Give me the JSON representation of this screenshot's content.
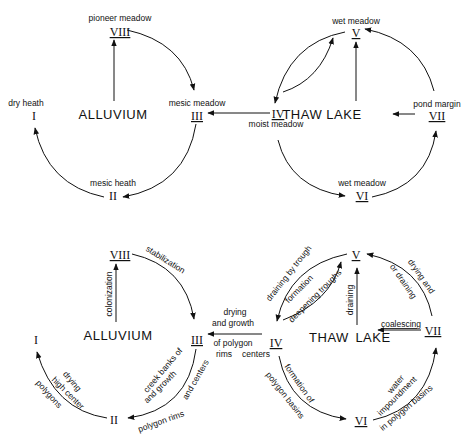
{
  "diagram": {
    "title": "",
    "panels": [
      {
        "id": "top-left",
        "center_label": "ALLUVIUM",
        "nodes": [
          {
            "id": "VIII",
            "numeral": "VIII",
            "label": "pioneer meadow"
          },
          {
            "id": "III",
            "numeral": "III",
            "label": "mesic meadow"
          },
          {
            "id": "II",
            "numeral": "II",
            "label": "mesic heath"
          },
          {
            "id": "I",
            "numeral": "I",
            "label": "dry heath"
          }
        ],
        "edges": [
          {
            "from": "ALLUVIUM",
            "to": "VIII",
            "label": ""
          },
          {
            "from": "VIII",
            "to": "III",
            "label": ""
          },
          {
            "from": "III",
            "to": "II",
            "label": ""
          },
          {
            "from": "II",
            "to": "I",
            "label": ""
          }
        ]
      },
      {
        "id": "top-right",
        "center_label": "THAW LAKE",
        "nodes": [
          {
            "id": "V",
            "numeral": "V",
            "label": "wet meadow"
          },
          {
            "id": "IV",
            "numeral": "IV",
            "label": "moist meadow"
          },
          {
            "id": "VI",
            "numeral": "VI",
            "label": "wet meadow"
          },
          {
            "id": "VII",
            "numeral": "VII",
            "label": "pond margin"
          }
        ],
        "edges": [
          {
            "from": "THAW LAKE",
            "to": "V",
            "label": ""
          },
          {
            "from": "V",
            "to": "IV",
            "label": ""
          },
          {
            "from": "IV",
            "to": "V",
            "label": ""
          },
          {
            "from": "IV",
            "to": "VI",
            "label": ""
          },
          {
            "from": "VI",
            "to": "VII",
            "label": ""
          },
          {
            "from": "VII",
            "to": "V",
            "label": ""
          },
          {
            "from": "VII",
            "to": "THAW LAKE",
            "label": ""
          }
        ]
      },
      {
        "id": "bottom-left",
        "center_label": "ALLUVIUM",
        "nodes": [
          {
            "id": "VIII",
            "numeral": "VIII"
          },
          {
            "id": "III",
            "numeral": "III"
          },
          {
            "id": "II",
            "numeral": "II"
          },
          {
            "id": "I",
            "numeral": "I"
          }
        ],
        "edges": [
          {
            "from": "ALLUVIUM",
            "to": "VIII",
            "label": "colonization"
          },
          {
            "from": "VIII",
            "to": "III",
            "label": "stabilization"
          },
          {
            "from": "III",
            "to": "II",
            "label_lines": [
              "creek banks",
              "and growth of",
              "polygon rims and centers"
            ]
          },
          {
            "from": "II",
            "to": "I",
            "label_lines": [
              "drying",
              "high center",
              "polygons"
            ]
          }
        ]
      },
      {
        "id": "bottom-right",
        "center_label": "THAW LAKE",
        "nodes": [
          {
            "id": "V",
            "numeral": "V"
          },
          {
            "id": "IV",
            "numeral": "IV"
          },
          {
            "id": "VI",
            "numeral": "VI"
          },
          {
            "id": "VII",
            "numeral": "VII"
          }
        ],
        "edges": [
          {
            "from": "THAW LAKE",
            "to": "V",
            "label": "draining"
          },
          {
            "from": "V",
            "to": "IV",
            "label_lines": [
              "draining by trough",
              "formation"
            ]
          },
          {
            "from": "IV",
            "to": "V",
            "label": "deepening troughs"
          },
          {
            "from": "IV",
            "to": "VI",
            "label_lines": [
              "formation of",
              "polygon basins"
            ]
          },
          {
            "from": "VI",
            "to": "VII",
            "label_lines": [
              "water",
              "impoundment",
              "in polygon basins"
            ]
          },
          {
            "from": "VII",
            "to": "V",
            "label_lines": [
              "drying and",
              "or draining"
            ]
          },
          {
            "from": "VII",
            "to": "THAW LAKE",
            "label": "coalescing"
          }
        ]
      }
    ],
    "cross_links": [
      {
        "panel": "top",
        "from": "IV",
        "to": "III",
        "label": ""
      },
      {
        "panel": "bottom",
        "from": "IV",
        "to": "III",
        "label_lines": [
          "drying",
          "and growth",
          "of polygon",
          "rims   centers"
        ]
      }
    ]
  },
  "text": {
    "tl_alluvium": "ALLUVIUM",
    "tl_viii": "VIII",
    "tl_viii_lbl": "pioneer meadow",
    "tl_iii": "III",
    "tl_iii_lbl": "mesic meadow",
    "tl_ii": "II",
    "tl_ii_lbl": "mesic heath",
    "tl_i": "I",
    "tl_i_lbl": "dry heath",
    "tr_thaw": "THAW  LAKE",
    "tr_v": "V",
    "tr_v_lbl": "wet  meadow",
    "tr_iv": "IV",
    "tr_iv_lbl": "moist meadow",
    "tr_vi": "VI",
    "tr_vi_lbl": "wet meadow",
    "tr_vii": "VII",
    "tr_vii_lbl": "pond margin",
    "bl_alluvium": "ALLUVIUM",
    "bl_viii": "VIII",
    "bl_iii": "III",
    "bl_ii": "II",
    "bl_i": "I",
    "bl_colonization": "colonization",
    "bl_stabilization": "stabilization",
    "bl_creek": "creek banks of",
    "bl_growth": "and growth",
    "bl_rims": "and centers",
    "bl_polygon": "polygon rims",
    "bl_drying": "drying",
    "bl_highcenter": "high center",
    "bl_polygons": "polygons",
    "mid_drying": "drying",
    "mid_growth": "and growth",
    "mid_ofpoly": "of polygon",
    "mid_rims": "rims",
    "mid_centers": "centers",
    "br_thaw1": "THAW",
    "br_thaw2": "LAKE",
    "br_v": "V",
    "br_iv": "IV",
    "br_vi": "VI",
    "br_vii": "VII",
    "br_draining": "draining",
    "br_coalescing": "coalescing",
    "br_draining_by": "draining by trough",
    "br_formation": "formation",
    "br_deepening": "deepening troughs",
    "br_formation_of": "formation of",
    "br_polygon_basins": "polygon basins",
    "br_water": "water",
    "br_impoundment": "impoundment",
    "br_in_polygon": "in polygon basins",
    "br_drying_and": "drying and",
    "br_or_draining": "or draining"
  }
}
